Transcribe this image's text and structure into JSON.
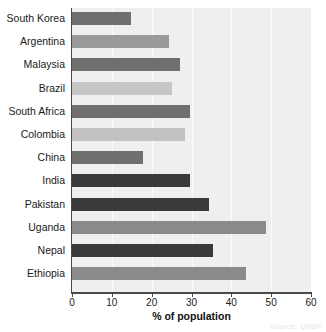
{
  "chart_data": {
    "type": "bar",
    "orientation": "horizontal",
    "title": "",
    "xlabel": "% of population",
    "ylabel": "",
    "xlim": [
      0,
      60
    ],
    "xticks": [
      0,
      10,
      20,
      30,
      40,
      50,
      60
    ],
    "grid": true,
    "legend": "none",
    "categories": [
      "South Korea",
      "Argentina",
      "Malaysia",
      "Brazil",
      "South Africa",
      "Colombia",
      "China",
      "India",
      "Pakistan",
      "Uganda",
      "Nepal",
      "Ethiopia"
    ],
    "values": [
      14.8,
      24.4,
      27.0,
      25.0,
      29.6,
      28.4,
      17.8,
      29.6,
      34.4,
      48.7,
      35.4,
      43.7
    ],
    "bar_colors": [
      "#6f6f6f",
      "#9a9a9a",
      "#6f6f6f",
      "#c6c6c6",
      "#6f6f6f",
      "#c2c2c2",
      "#6f6f6f",
      "#3a3a3a",
      "#3a3a3a",
      "#8a8a8a",
      "#3a3a3a",
      "#8a8a8a"
    ]
  },
  "style": {
    "plot_background": "#efefef",
    "gridline_color": "#fbfbfb",
    "axis_color": "#4a4a4a",
    "text_color": "#1a1a1a"
  },
  "watermark": "Source: UNDP"
}
